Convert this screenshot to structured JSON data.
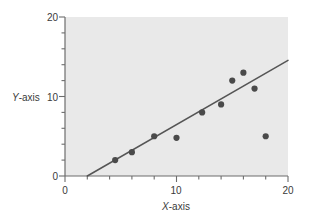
{
  "chart_data": {
    "type": "scatter",
    "title": "",
    "xlabel": "X-axis",
    "ylabel": "Y-axis",
    "xlim": [
      0,
      20
    ],
    "ylim": [
      0,
      20
    ],
    "xticks": [
      0,
      10,
      20
    ],
    "yticks": [
      0,
      10,
      20
    ],
    "xtick_labels": [
      "0",
      "10",
      "20"
    ],
    "ytick_labels": [
      "0",
      "10",
      "20"
    ],
    "minor_tick_step": 2,
    "grid": false,
    "legend": null,
    "points": [
      {
        "x": 4.5,
        "y": 2
      },
      {
        "x": 6,
        "y": 3
      },
      {
        "x": 8,
        "y": 5
      },
      {
        "x": 10,
        "y": 4.8
      },
      {
        "x": 12.3,
        "y": 8
      },
      {
        "x": 14,
        "y": 9
      },
      {
        "x": 15,
        "y": 12
      },
      {
        "x": 16,
        "y": 13
      },
      {
        "x": 17,
        "y": 11
      },
      {
        "x": 18,
        "y": 5
      }
    ],
    "trendline": {
      "name": "fitted-line",
      "x_start": 2.0,
      "y_start": 0,
      "x_end": 20.8,
      "y_end": 15.2
    },
    "colors": {
      "plot_background": "#e9e9e9",
      "point": "#4a4a4a",
      "line": "#555555",
      "axis": "#6d6d6d",
      "text": "#3a3a3a",
      "page_background": "#ffffff"
    }
  },
  "axes": {
    "y_label_text": "Y",
    "y_label_suffix": "-axis",
    "x_label_text": "X",
    "x_label_suffix": "-axis"
  },
  "y_tick_labels": {
    "top": "20",
    "mid": "10",
    "bottom": "0"
  },
  "x_tick_labels": {
    "left": "0",
    "mid": "10",
    "right": "20"
  }
}
